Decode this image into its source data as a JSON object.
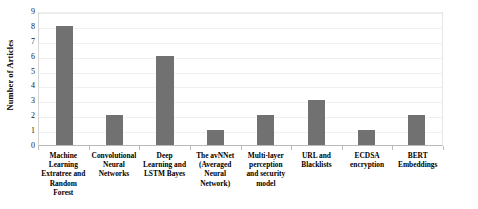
{
  "chart_data": {
    "type": "bar",
    "title": "",
    "xlabel": "",
    "ylabel": "Number of Articles",
    "ylim": [
      0,
      9
    ],
    "yticks": [
      0,
      1,
      2,
      3,
      4,
      5,
      6,
      7,
      8,
      9
    ],
    "grid": true,
    "legend": false,
    "bar_color": "#717171",
    "categories": [
      "Machine Learning Extratree and Random Forest",
      "Convolutional Neural Networks",
      "Deep Learning and LSTM Bayes",
      "The avNNet (Averaged Neural Network)",
      "Multi-layer perception and security model",
      "URL and Blacklists",
      "ECDSA encryption",
      "BERT Embeddings"
    ],
    "category_lines": [
      [
        "Machine",
        "Learning",
        "Extratree and",
        "Random",
        "Forest"
      ],
      [
        "Convolutional",
        "Neural",
        "Networks"
      ],
      [
        "Deep",
        "Learning and",
        "LSTM Bayes"
      ],
      [
        "The avNNet",
        "(Averaged",
        "Neural",
        "Network)"
      ],
      [
        "Multi-layer",
        "perception",
        "and security",
        "model"
      ],
      [
        "URL and",
        "Blacklists"
      ],
      [
        "ECDSA",
        "encryption"
      ],
      [
        "BERT",
        "Embeddings"
      ]
    ],
    "values": [
      8,
      2,
      6,
      1,
      2,
      3,
      1,
      2
    ]
  },
  "axis": {
    "y_title": "Number of Articles",
    "y_tick_labels": [
      "0",
      "1",
      "2",
      "3",
      "4",
      "5",
      "6",
      "7",
      "8",
      "9"
    ]
  }
}
